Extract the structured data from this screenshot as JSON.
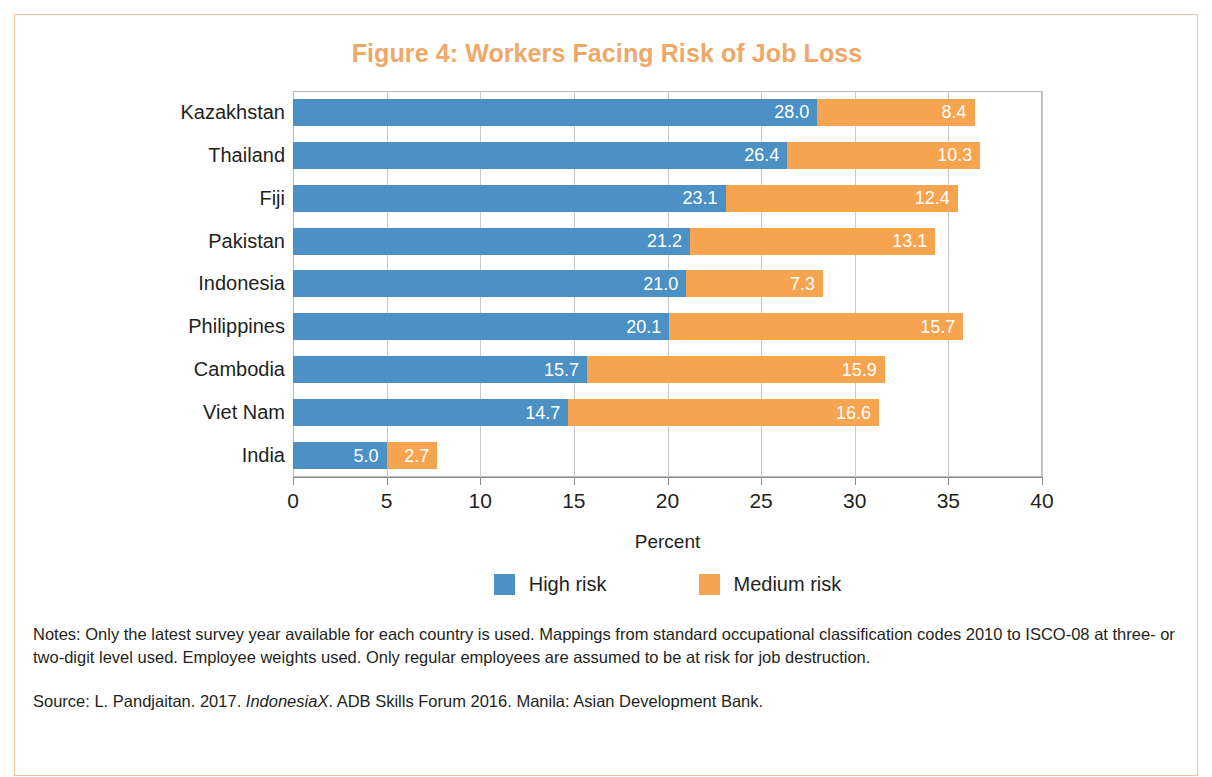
{
  "figure": {
    "title": "Figure 4: Workers Facing Risk of Job Loss",
    "title_color": "#f0a868",
    "border_color": "#f0c49a"
  },
  "chart_data": {
    "type": "bar",
    "orientation": "horizontal",
    "stacked": true,
    "title": "Figure 4: Workers Facing Risk of Job Loss",
    "xlabel": "Percent",
    "ylabel": "",
    "xlim": [
      0,
      40
    ],
    "xticks": [
      0,
      5,
      10,
      15,
      20,
      25,
      30,
      35,
      40
    ],
    "xtick_labels": [
      "0",
      "5",
      "10",
      "15",
      "20",
      "25",
      "30",
      "35",
      "40"
    ],
    "grid": "vertical",
    "legend_position": "bottom-center",
    "categories": [
      "Kazakhstan",
      "Thailand",
      "Fiji",
      "Pakistan",
      "Indonesia",
      "Philippines",
      "Cambodia",
      "Viet Nam",
      "India"
    ],
    "series": [
      {
        "name": "High risk",
        "color": "#4b91c6",
        "values": [
          28.0,
          26.4,
          23.1,
          21.2,
          21.0,
          20.1,
          15.7,
          14.7,
          5.0
        ],
        "labels": [
          "28.0",
          "26.4",
          "23.1",
          "21.2",
          "21.0",
          "20.1",
          "15.7",
          "14.7",
          "5.0"
        ]
      },
      {
        "name": "Medium risk",
        "color": "#f7a450",
        "values": [
          8.4,
          10.3,
          12.4,
          13.1,
          7.3,
          15.7,
          15.9,
          16.6,
          2.7
        ],
        "labels": [
          "8.4",
          "10.3",
          "12.4",
          "13.1",
          "7.3",
          "15.7",
          "15.9",
          "16.6",
          "2.7"
        ]
      }
    ]
  },
  "legend": {
    "items": [
      {
        "label": "High risk",
        "color": "#4b91c6"
      },
      {
        "label": "Medium risk",
        "color": "#f7a450"
      }
    ]
  },
  "footnotes": {
    "notes": "Notes: Only the latest survey year available for each country is used. Mappings from standard occupational classification codes 2010 to ISCO-08 at three- or two-digit level used. Employee weights used. Only regular employees are assumed to be at risk for job destruction.",
    "source_prefix": "Source: L. Pandjaitan. 2017. ",
    "source_italic": "IndonesiaX",
    "source_suffix": ". ADB Skills Forum 2016. Manila: Asian Development Bank."
  }
}
